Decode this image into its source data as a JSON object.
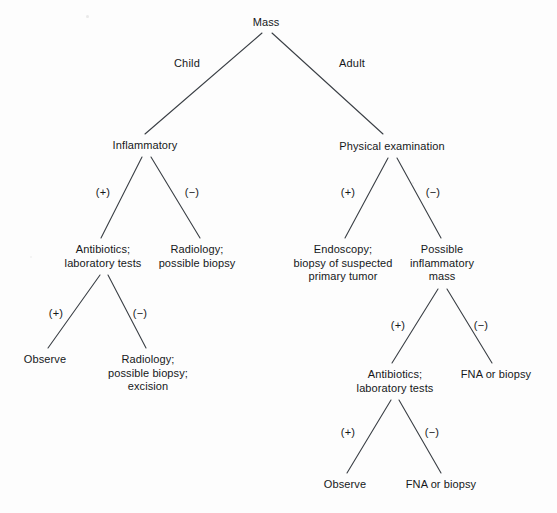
{
  "diagram": {
    "type": "decision-tree",
    "line_color": "#3a3f45",
    "text_color": "#16181a",
    "background": "#fdfdfd",
    "nodes": [
      {
        "id": "mass",
        "label": "Mass",
        "x": 266,
        "y": 16
      },
      {
        "id": "inflammatory",
        "label": "Inflammatory",
        "x": 145,
        "y": 139
      },
      {
        "id": "physical-exam",
        "label": "Physical examination",
        "x": 392,
        "y": 140
      },
      {
        "id": "antibiotics-left",
        "label": "Antibiotics;\nlaboratory tests",
        "x": 103,
        "y": 243
      },
      {
        "id": "radiology-biopsy",
        "label": "Radiology;\npossible biopsy",
        "x": 197,
        "y": 243
      },
      {
        "id": "endoscopy",
        "label": "Endoscopy;\nbiopsy of suspected\nprimary tumor",
        "x": 343,
        "y": 243
      },
      {
        "id": "possible-inflam",
        "label": "Possible\ninflammatory\nmass",
        "x": 442,
        "y": 243
      },
      {
        "id": "observe-left",
        "label": "Observe",
        "x": 45,
        "y": 353
      },
      {
        "id": "radiology-excision",
        "label": "Radiology;\npossible biopsy;\nexcision",
        "x": 148,
        "y": 353
      },
      {
        "id": "antibiotics-right",
        "label": "Antibiotics;\nlaboratory tests",
        "x": 395,
        "y": 368
      },
      {
        "id": "fna-biopsy-right",
        "label": "FNA or biopsy",
        "x": 496,
        "y": 368
      },
      {
        "id": "observe-bottom",
        "label": "Observe",
        "x": 345,
        "y": 478
      },
      {
        "id": "fna-biopsy-bottom",
        "label": "FNA or biopsy",
        "x": 441,
        "y": 478
      }
    ],
    "edges": [
      {
        "id": "mass-child",
        "from": "mass",
        "to": "inflammatory",
        "x1": 262,
        "y1": 33,
        "x2": 145,
        "y2": 134
      },
      {
        "id": "mass-adult",
        "from": "mass",
        "to": "physical-exam",
        "x1": 272,
        "y1": 33,
        "x2": 383,
        "y2": 134
      },
      {
        "id": "inflammatory-pos",
        "from": "inflammatory",
        "to": "antibiotics-left",
        "x1": 142,
        "y1": 157,
        "x2": 101,
        "y2": 238
      },
      {
        "id": "inflammatory-neg",
        "from": "inflammatory",
        "to": "radiology-biopsy",
        "x1": 151,
        "y1": 157,
        "x2": 200,
        "y2": 238
      },
      {
        "id": "physical-pos",
        "from": "physical-exam",
        "to": "endoscopy",
        "x1": 388,
        "y1": 158,
        "x2": 345,
        "y2": 238
      },
      {
        "id": "physical-neg",
        "from": "physical-exam",
        "to": "possible-inflam",
        "x1": 397,
        "y1": 158,
        "x2": 441,
        "y2": 238
      },
      {
        "id": "antibiotics-left-pos",
        "from": "antibiotics-left",
        "to": "observe-left",
        "x1": 100,
        "y1": 275,
        "x2": 48,
        "y2": 348
      },
      {
        "id": "antibiotics-left-neg",
        "from": "antibiotics-left",
        "to": "radiology-excision",
        "x1": 108,
        "y1": 275,
        "x2": 146,
        "y2": 348
      },
      {
        "id": "possible-inflam-pos",
        "from": "possible-inflam",
        "to": "antibiotics-right",
        "x1": 438,
        "y1": 289,
        "x2": 392,
        "y2": 363
      },
      {
        "id": "possible-inflam-neg",
        "from": "possible-inflam",
        "to": "fna-biopsy-right",
        "x1": 447,
        "y1": 289,
        "x2": 492,
        "y2": 363
      },
      {
        "id": "antibiotics-right-pos",
        "from": "antibiotics-right",
        "to": "observe-bottom",
        "x1": 391,
        "y1": 400,
        "x2": 347,
        "y2": 473
      },
      {
        "id": "antibiotics-right-neg",
        "from": "antibiotics-right",
        "to": "fna-biopsy-bottom",
        "x1": 399,
        "y1": 400,
        "x2": 441,
        "y2": 473
      }
    ],
    "edge_labels": [
      {
        "id": "label-child",
        "text": "Child",
        "x": 187,
        "y": 63
      },
      {
        "id": "label-adult",
        "text": "Adult",
        "x": 352,
        "y": 63
      },
      {
        "id": "label-inflam-pos",
        "text": "(+)",
        "x": 103,
        "y": 192
      },
      {
        "id": "label-inflam-neg",
        "text": "(−)",
        "x": 192,
        "y": 192
      },
      {
        "id": "label-physical-pos",
        "text": "(+)",
        "x": 348,
        "y": 192
      },
      {
        "id": "label-physical-neg",
        "text": "(−)",
        "x": 433,
        "y": 192
      },
      {
        "id": "label-abx-left-pos",
        "text": "(+)",
        "x": 56,
        "y": 313
      },
      {
        "id": "label-abx-left-neg",
        "text": "(−)",
        "x": 140,
        "y": 313
      },
      {
        "id": "label-poss-inflam-pos",
        "text": "(+)",
        "x": 398,
        "y": 325
      },
      {
        "id": "label-poss-inflam-neg",
        "text": "(−)",
        "x": 481,
        "y": 325
      },
      {
        "id": "label-abx-right-pos",
        "text": "(+)",
        "x": 348,
        "y": 432
      },
      {
        "id": "label-abx-right-neg",
        "text": "(−)",
        "x": 432,
        "y": 432
      }
    ]
  }
}
